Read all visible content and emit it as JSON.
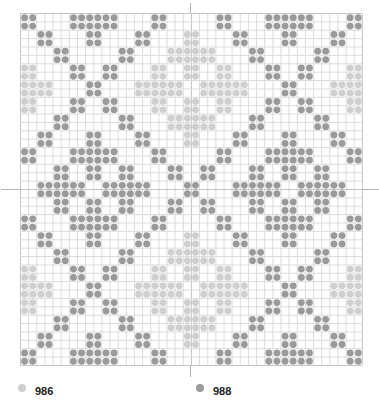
{
  "chart": {
    "columns": 42,
    "rows": 42,
    "cell_width": 8.14,
    "cell_height": 8.38,
    "grid_color": "#dcdcdc",
    "major_grid_color": "#c4c4c4",
    "major_every": 10,
    "symbols": {
      "D": {
        "code": "988",
        "color": "#9a9a9a"
      },
      "L": {
        "code": "986",
        "color": "#cfcfcf"
      }
    },
    "top_half_row_pairs": [
      {
        "rows": [
          0,
          1
        ],
        "D": [
          [
            0,
            1
          ],
          [
            6,
            11
          ],
          [
            16,
            17
          ]
        ],
        "L": []
      },
      {
        "rows": [
          2,
          3
        ],
        "D": [
          [
            2,
            3
          ],
          [
            8,
            9
          ],
          [
            14,
            15
          ]
        ],
        "L": [
          [
            20,
            21
          ]
        ]
      },
      {
        "rows": [
          4,
          5
        ],
        "D": [
          [
            4,
            5
          ],
          [
            12,
            13
          ]
        ],
        "L": [
          [
            18,
            21
          ]
        ]
      },
      {
        "rows": [
          6,
          7
        ],
        "D": [
          [
            6,
            7
          ],
          [
            10,
            11
          ]
        ],
        "L": [
          [
            0,
            1
          ],
          [
            16,
            17
          ],
          [
            20,
            21
          ]
        ]
      },
      {
        "rows": [
          8,
          9
        ],
        "D": [
          [
            8,
            9
          ]
        ],
        "L": [
          [
            0,
            3
          ],
          [
            14,
            19
          ]
        ]
      },
      {
        "rows": [
          10,
          11
        ],
        "D": [
          [
            6,
            7
          ],
          [
            10,
            11
          ]
        ],
        "L": [
          [
            0,
            1
          ],
          [
            16,
            17
          ],
          [
            20,
            21
          ]
        ]
      },
      {
        "rows": [
          12,
          13
        ],
        "D": [
          [
            4,
            5
          ],
          [
            12,
            13
          ]
        ],
        "L": [
          [
            18,
            21
          ]
        ]
      },
      {
        "rows": [
          14,
          15
        ],
        "D": [
          [
            2,
            3
          ],
          [
            8,
            9
          ],
          [
            14,
            15
          ]
        ],
        "L": [
          [
            20,
            21
          ]
        ]
      },
      {
        "rows": [
          16,
          17
        ],
        "D": [
          [
            0,
            1
          ],
          [
            6,
            11
          ],
          [
            16,
            17
          ]
        ],
        "L": []
      },
      {
        "rows": [
          18,
          19
        ],
        "D": [
          [
            4,
            5
          ],
          [
            8,
            9
          ],
          [
            12,
            13
          ],
          [
            18,
            19
          ]
        ],
        "L": []
      },
      {
        "rows": [
          20,
          21
        ],
        "D": [
          [
            2,
            7
          ],
          [
            10,
            15
          ],
          [
            20,
            21
          ]
        ],
        "L": []
      }
    ],
    "symmetry": "mirror horizontally about center column gap (col c <-> 41-c) and vertically about center row gap (row r <-> 41-r)"
  },
  "legend": [
    {
      "code": "986",
      "color": "#cfcfcf"
    },
    {
      "code": "988",
      "color": "#9a9a9a"
    }
  ]
}
